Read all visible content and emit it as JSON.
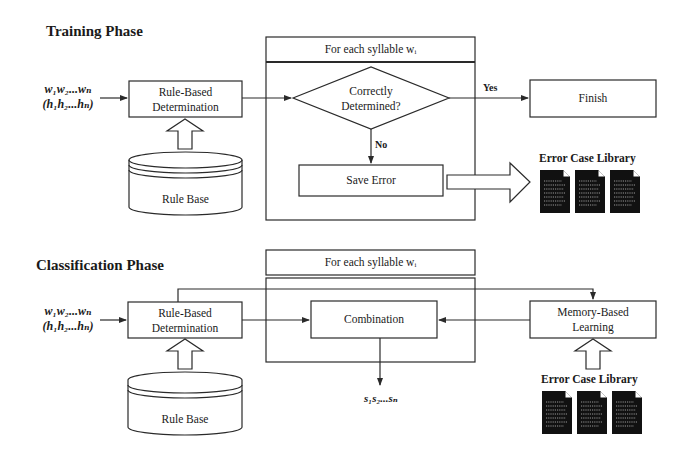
{
  "training": {
    "title": "Training Phase",
    "input_line1": "w₁w₂...wₙ",
    "input_line2": "(h₁h₂...hₙ)",
    "rule_based_line1": "Rule-Based",
    "rule_based_line2": "Determination",
    "rule_base": "Rule Base",
    "loop_header": "For each syllable wᵢ",
    "decision_line1": "Correctly",
    "decision_line2": "Determined?",
    "yes_label": "Yes",
    "no_label": "No",
    "finish": "Finish",
    "save_error": "Save Error",
    "library_label": "Error Case Library"
  },
  "classification": {
    "title": "Classification Phase",
    "input_line1": "w₁w₂...wₙ",
    "input_line2": "(h₁h₂...hₙ)",
    "rule_based_line1": "Rule-Based",
    "rule_based_line2": "Determination",
    "rule_base": "Rule Base",
    "loop_header": "For each syllable wᵢ",
    "combination": "Combination",
    "memory_line1": "Memory-Based",
    "memory_line2": "Learning",
    "library_label": "Error Case Library",
    "output": "s₁s₂...sₙ"
  },
  "colors": {
    "stroke": "#2a2a2a",
    "doc_fill": "#111111",
    "background": "#ffffff"
  }
}
